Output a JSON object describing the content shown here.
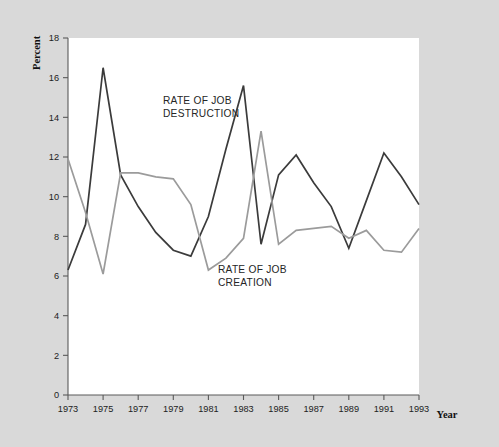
{
  "chart_data": {
    "type": "line",
    "title": "",
    "xlabel": "Year",
    "ylabel": "Percent",
    "xlim": [
      1973,
      1993
    ],
    "ylim": [
      0,
      18
    ],
    "grid": false,
    "legend_position": "inline-annotation",
    "x": [
      1973,
      1974,
      1975,
      1976,
      1977,
      1978,
      1979,
      1980,
      1981,
      1982,
      1983,
      1984,
      1985,
      1986,
      1987,
      1988,
      1989,
      1990,
      1991,
      1992,
      1993
    ],
    "xtick_labels": [
      "1973",
      "1975",
      "1977",
      "1979",
      "1981",
      "1983",
      "1985",
      "1987",
      "1989",
      "1991",
      "1993"
    ],
    "xtick_values": [
      1973,
      1975,
      1977,
      1979,
      1981,
      1983,
      1985,
      1987,
      1989,
      1991,
      1993
    ],
    "ytick_labels": [
      "0",
      "2",
      "4",
      "6",
      "8",
      "10",
      "12",
      "14",
      "16",
      "18"
    ],
    "ytick_values": [
      0,
      2,
      4,
      6,
      8,
      10,
      12,
      14,
      16,
      18
    ],
    "series": [
      {
        "name": "RATE OF JOB DESTRUCTION",
        "color": "#3b3b3b",
        "width": 1.7,
        "values": [
          6.3,
          8.6,
          16.5,
          11.1,
          9.5,
          8.2,
          7.3,
          7.0,
          9.0,
          12.4,
          15.6,
          7.6,
          11.1,
          12.1,
          10.7,
          9.5,
          7.4,
          9.8,
          12.2,
          11.0,
          9.6
        ]
      },
      {
        "name": "RATE OF JOB CREATION",
        "color": "#9b9b9b",
        "width": 1.7,
        "values": [
          11.9,
          9.2,
          6.1,
          11.2,
          11.2,
          11.0,
          10.9,
          9.6,
          6.3,
          6.9,
          7.9,
          13.3,
          7.6,
          8.3,
          8.4,
          8.5,
          7.9,
          8.3,
          7.3,
          7.2,
          8.4
        ]
      }
    ],
    "annotations": [
      {
        "id": "destruction-label",
        "line1": "RATE OF JOB",
        "line2": "DESTRUCTION",
        "x_px": 163,
        "y_px": 104
      },
      {
        "id": "creation-label",
        "line1": "RATE OF JOB",
        "line2": "CREATION",
        "x_px": 218,
        "y_px": 273
      }
    ]
  },
  "axes": {
    "y_title": "Percent",
    "x_title": "Year"
  },
  "colors": {
    "page_background": "#d9d9d9",
    "plot_background": "#ffffff",
    "axis": "#5a5a5a",
    "destruction": "#3b3b3b",
    "creation": "#9b9b9b"
  }
}
